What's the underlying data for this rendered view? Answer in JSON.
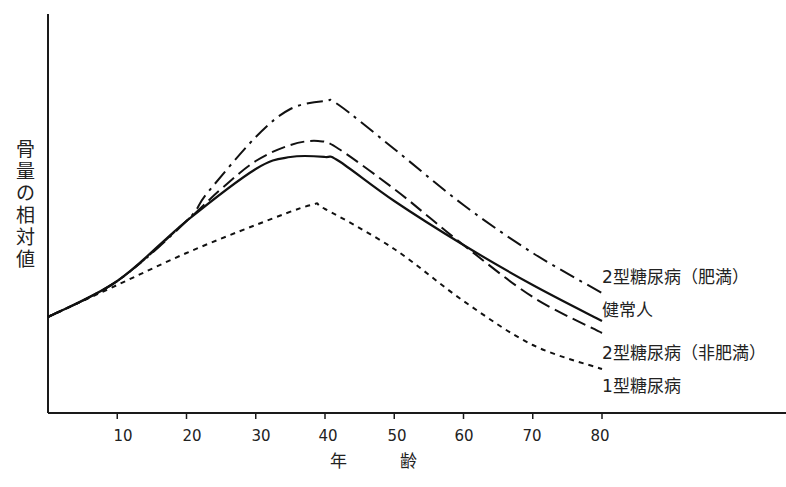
{
  "chart_data": {
    "type": "line",
    "title": "",
    "xlabel": "年　齢",
    "ylabel": "骨量の相対値",
    "xlim": [
      0,
      90
    ],
    "ylim": [
      0,
      1
    ],
    "x_ticks": [
      10,
      20,
      30,
      40,
      50,
      60,
      70,
      80
    ],
    "y_ticks": [],
    "grid": false,
    "legend_position": "right-inline",
    "series": [
      {
        "name": "2型糖尿病(肥満)",
        "style": "dash-dot",
        "x": [
          0,
          10,
          20,
          23,
          30,
          35,
          40,
          42,
          50,
          60,
          70,
          80
        ],
        "values": [
          0.24,
          0.33,
          0.48,
          0.55,
          0.69,
          0.76,
          0.78,
          0.77,
          0.66,
          0.52,
          0.4,
          0.3
        ]
      },
      {
        "name": "健常人",
        "style": "solid",
        "x": [
          0,
          10,
          20,
          30,
          35,
          40,
          42,
          50,
          60,
          70,
          80
        ],
        "values": [
          0.24,
          0.33,
          0.48,
          0.61,
          0.64,
          0.64,
          0.63,
          0.53,
          0.42,
          0.32,
          0.23
        ]
      },
      {
        "name": "2型糖尿病(非肥満)",
        "style": "dashed",
        "x": [
          0,
          10,
          20,
          25,
          30,
          35,
          39,
          42,
          50,
          55,
          60,
          70,
          80
        ],
        "values": [
          0.24,
          0.33,
          0.48,
          0.56,
          0.63,
          0.67,
          0.68,
          0.66,
          0.56,
          0.49,
          0.42,
          0.29,
          0.2
        ]
      },
      {
        "name": "1型糖尿病",
        "style": "dotted",
        "x": [
          0,
          10,
          20,
          30,
          38,
          40,
          50,
          60,
          70,
          80
        ],
        "values": [
          0.24,
          0.32,
          0.4,
          0.47,
          0.52,
          0.51,
          0.41,
          0.28,
          0.17,
          0.11
        ]
      }
    ],
    "annotations": [
      "2型糖尿病(肥満)",
      "健常人",
      "2型糖尿病(非肥満)",
      "1型糖尿病"
    ]
  },
  "axis": {
    "ylabel_chars": [
      "骨",
      "量",
      "の",
      "相",
      "対",
      "値"
    ],
    "xlabel": "年　齢",
    "ticks": [
      "10",
      "20",
      "30",
      "40",
      "50",
      "60",
      "70",
      "80"
    ]
  },
  "legend": {
    "obese_t2": "2型糖尿病（肥満）",
    "healthy": "健常人",
    "nonobese_t2": "2型糖尿病（非肥満）",
    "t1": "1型糖尿病"
  },
  "caption": ""
}
